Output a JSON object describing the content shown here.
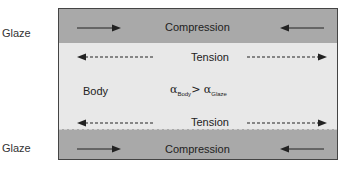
{
  "labels": {
    "glaze_top": "Glaze",
    "glaze_bottom": "Glaze",
    "compression_top": "Compression",
    "compression_bottom": "Compression",
    "tension_top": "Tension",
    "tension_bottom": "Tension",
    "body": "Body"
  },
  "formula": {
    "alpha": "α",
    "left_sub": "Body",
    "operator": ">",
    "right_sub": "Glaze"
  },
  "colors": {
    "glaze": "#a9a9a9",
    "body": "#e8e8e8",
    "border": "#444444",
    "arrow": "#222222"
  },
  "arrows": [
    {
      "layer": "glaze-top",
      "side": "left",
      "direction": "right",
      "style": "solid"
    },
    {
      "layer": "glaze-top",
      "side": "right",
      "direction": "left",
      "style": "solid"
    },
    {
      "layer": "body-top",
      "side": "left",
      "direction": "left",
      "style": "dashed"
    },
    {
      "layer": "body-top",
      "side": "right",
      "direction": "right",
      "style": "dashed"
    },
    {
      "layer": "body-bottom",
      "side": "left",
      "direction": "left",
      "style": "dashed"
    },
    {
      "layer": "body-bottom",
      "side": "right",
      "direction": "right",
      "style": "dashed"
    },
    {
      "layer": "glaze-bottom",
      "side": "left",
      "direction": "right",
      "style": "solid"
    },
    {
      "layer": "glaze-bottom",
      "side": "right",
      "direction": "left",
      "style": "solid"
    }
  ]
}
